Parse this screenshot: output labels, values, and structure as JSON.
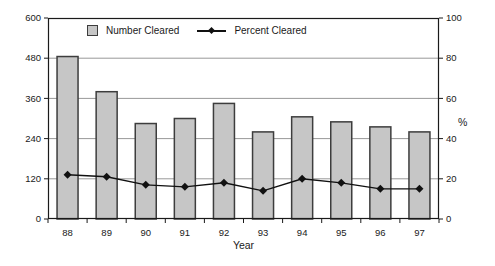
{
  "chart_data": {
    "type": "bar",
    "title": "",
    "categories": [
      "88",
      "89",
      "90",
      "91",
      "92",
      "93",
      "94",
      "95",
      "96",
      "97"
    ],
    "series": [
      {
        "name": "Number Cleared",
        "type": "bar",
        "axis": "left",
        "values": [
          485,
          380,
          285,
          300,
          345,
          260,
          305,
          290,
          275,
          260
        ]
      },
      {
        "name": "Percent Cleared",
        "type": "line",
        "axis": "right",
        "values": [
          22,
          21,
          17,
          16,
          18,
          14,
          20,
          18,
          15,
          15
        ]
      }
    ],
    "xlabel": "Year",
    "axes": {
      "left": {
        "range": [
          0,
          600
        ],
        "ticks": [
          0,
          120,
          240,
          360,
          480,
          600
        ],
        "label": ""
      },
      "right": {
        "range": [
          0,
          100
        ],
        "ticks": [
          0,
          20,
          40,
          60,
          80,
          100
        ],
        "label": "%"
      }
    },
    "grid": true,
    "legend_position": "top-inside",
    "colors": {
      "bar_fill": "#c6c6c6",
      "bar_border": "#3d3d3d",
      "line": "#111111",
      "grid": "#999999",
      "frame": "#1a1a1a",
      "text": "#1a1a1a",
      "background": "#ffffff"
    }
  }
}
